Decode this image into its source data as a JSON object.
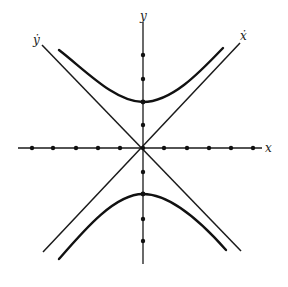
{
  "diagram": {
    "type": "phase-plane hyperbola with asymptotes",
    "labels": {
      "y_axis": "y",
      "x_axis": "x",
      "ydot_line": "ẏ",
      "xdot_line": "ẋ"
    },
    "colors": {
      "ink": "#111111",
      "background": "#ffffff"
    },
    "origin": [
      143,
      148
    ],
    "x_axis_dots": [
      32,
      53,
      76,
      98,
      120,
      164,
      187,
      209,
      231,
      253
    ],
    "y_axis_dots": [
      55,
      79,
      102,
      125,
      172,
      194,
      219,
      241
    ],
    "curves": [
      {
        "name": "upper-hyperbola-branch",
        "vertex": [
          143,
          102
        ]
      },
      {
        "name": "lower-hyperbola-branch",
        "vertex": [
          143,
          194
        ]
      }
    ],
    "asymptotes": [
      {
        "name": "ydot-line",
        "from": [
          42,
          45
        ],
        "to": [
          241,
          251
        ]
      },
      {
        "name": "xdot-line",
        "from": [
          240,
          43
        ],
        "to": [
          43,
          252
        ]
      }
    ]
  }
}
